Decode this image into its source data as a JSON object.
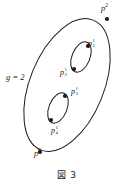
{
  "figure": {
    "caption": "図 3",
    "genus_label": "g = 2",
    "background_color": "#ffffff",
    "stroke_color": "#1a1a1a"
  },
  "diagram": {
    "type": "genus-2-surface-schematic",
    "outer_curve": {
      "name": "outer-ellipse",
      "cx": 67,
      "cy": 85,
      "rx": 37,
      "ry": 70,
      "rotation_deg": 22
    },
    "inner_curves": [
      {
        "name": "upper-handle-oval",
        "cx": 81,
        "cy": 57,
        "rx": 9,
        "ry": 16,
        "rotation_deg": 22
      },
      {
        "name": "lower-handle-oval",
        "cx": 58,
        "cy": 108,
        "rx": 9,
        "ry": 16,
        "rotation_deg": 22
      }
    ],
    "points": [
      {
        "id": "p2",
        "base": "p",
        "superscript": "2",
        "subscript": "",
        "x": 107,
        "y": 19,
        "label_x": 101,
        "label_y": 4,
        "on": "outer-ellipse"
      },
      {
        "id": "p0",
        "base": "p",
        "superscript": "0",
        "subscript": "",
        "x": 40,
        "y": 152,
        "label_x": 34,
        "label_y": 149,
        "on": "outer-ellipse"
      },
      {
        "id": "p11",
        "base": "p",
        "superscript": "1",
        "subscript": "1",
        "x": 88,
        "y": 46,
        "label_x": 88,
        "label_y": 38,
        "on": "upper-handle-oval"
      },
      {
        "id": "p21",
        "base": "p",
        "superscript": "1",
        "subscript": "2",
        "x": 74,
        "y": 69,
        "label_x": 60,
        "label_y": 67,
        "on": "upper-handle-oval"
      },
      {
        "id": "p31",
        "base": "p",
        "superscript": "1",
        "subscript": "3",
        "x": 65,
        "y": 96,
        "label_x": 71,
        "label_y": 86,
        "on": "lower-handle-oval"
      },
      {
        "id": "p41",
        "base": "p",
        "superscript": "1",
        "subscript": "4",
        "x": 51,
        "y": 120,
        "label_x": 51,
        "label_y": 125,
        "on": "lower-handle-oval"
      }
    ]
  },
  "labels": {
    "p2_base": "p",
    "p2_sup": "2",
    "p0_base": "p",
    "p0_sup": "0",
    "p11_base": "p",
    "p11_sup": "1",
    "p11_sub": "1",
    "p21_base": "p",
    "p21_sup": "1",
    "p21_sub": "2",
    "p31_base": "p",
    "p31_sup": "1",
    "p31_sub": "3",
    "p41_base": "p",
    "p41_sup": "1",
    "p41_sub": "4"
  }
}
